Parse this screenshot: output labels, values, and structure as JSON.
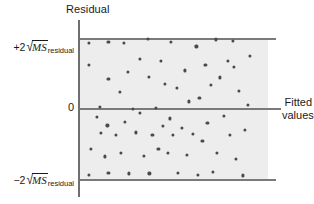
{
  "figure": {
    "type": "residual-plot",
    "axis_title": "Residual",
    "x_axis_label_line1": "Fitted",
    "x_axis_label_line2": "values",
    "zero_tick": "0",
    "upper_limit": {
      "sign": "+2",
      "radical_glyph": "√",
      "radicand": "MS",
      "subscript": "residual",
      "full_text": "+2√MS_residual"
    },
    "lower_limit": {
      "sign": "−2",
      "radical_glyph": "√",
      "radicand": "MS",
      "subscript": "residual",
      "full_text": "−2√MS_residual"
    },
    "colors": {
      "band_fill": "#ededed",
      "reference_line": "#7a7a7a",
      "axis_line": "#6f6f6f",
      "point_fill": "#4a4a4a",
      "background": "#ffffff",
      "text": "#1a1a1a"
    }
  },
  "chart_data": {
    "type": "scatter",
    "title": "",
    "xlabel": "Fitted values",
    "ylabel": "Residual",
    "grid": false,
    "legend": "none",
    "xlim": [
      0,
      100
    ],
    "ylim": [
      -1.1,
      1.1
    ],
    "reference_lines": [
      {
        "name": "upper-limit",
        "y": 1.0,
        "label": "+2√MS_residual"
      },
      {
        "name": "zero",
        "y": 0.0,
        "label": "0"
      },
      {
        "name": "lower-limit",
        "y": -1.0,
        "label": "−2√MS_residual"
      }
    ],
    "band": {
      "y_from": -1.0,
      "y_to": 1.0,
      "fill": "#ededed"
    },
    "points": [
      {
        "x": 4.2,
        "y": 0.93
      },
      {
        "x": 4.2,
        "y": 0.62
      },
      {
        "x": 5.3,
        "y": -0.57
      },
      {
        "x": 4.2,
        "y": -0.94
      },
      {
        "x": 8.5,
        "y": -0.12
      },
      {
        "x": 10.1,
        "y": 0.02
      },
      {
        "x": 10.6,
        "y": -0.35
      },
      {
        "x": 12.7,
        "y": -0.68
      },
      {
        "x": 14.8,
        "y": 0.94
      },
      {
        "x": 14.8,
        "y": 0.42
      },
      {
        "x": 14.3,
        "y": -0.24
      },
      {
        "x": 14.8,
        "y": -0.91
      },
      {
        "x": 19.0,
        "y": -0.37
      },
      {
        "x": 21.2,
        "y": 0.23
      },
      {
        "x": 21.7,
        "y": -0.63
      },
      {
        "x": 23.3,
        "y": 0.93
      },
      {
        "x": 23.8,
        "y": -0.19
      },
      {
        "x": 25.4,
        "y": 0.52
      },
      {
        "x": 25.9,
        "y": -0.92
      },
      {
        "x": 28.0,
        "y": 0.0
      },
      {
        "x": 29.6,
        "y": -0.34
      },
      {
        "x": 31.7,
        "y": 0.7
      },
      {
        "x": 31.7,
        "y": -0.06
      },
      {
        "x": 33.9,
        "y": -0.67
      },
      {
        "x": 36.0,
        "y": 0.99
      },
      {
        "x": 36.5,
        "y": 0.45
      },
      {
        "x": 37.0,
        "y": -0.92
      },
      {
        "x": 38.6,
        "y": -0.38
      },
      {
        "x": 40.7,
        "y": 0.01
      },
      {
        "x": 41.8,
        "y": -0.57
      },
      {
        "x": 43.4,
        "y": 0.68
      },
      {
        "x": 44.4,
        "y": -0.25
      },
      {
        "x": 45.5,
        "y": 0.35
      },
      {
        "x": 47.1,
        "y": -0.63
      },
      {
        "x": 48.7,
        "y": 0.95
      },
      {
        "x": 48.1,
        "y": -0.14
      },
      {
        "x": 49.7,
        "y": -0.37
      },
      {
        "x": 51.9,
        "y": 0.29
      },
      {
        "x": 52.4,
        "y": -0.91
      },
      {
        "x": 54.5,
        "y": -0.27
      },
      {
        "x": 56.1,
        "y": 0.54
      },
      {
        "x": 57.1,
        "y": -0.66
      },
      {
        "x": 58.2,
        "y": 0.1
      },
      {
        "x": 60.3,
        "y": -0.36
      },
      {
        "x": 62.4,
        "y": 0.88
      },
      {
        "x": 63.0,
        "y": -0.94
      },
      {
        "x": 64.0,
        "y": 0.15
      },
      {
        "x": 65.6,
        "y": -0.46
      },
      {
        "x": 67.2,
        "y": 0.62
      },
      {
        "x": 68.3,
        "y": -0.21
      },
      {
        "x": 70.4,
        "y": 0.33
      },
      {
        "x": 71.4,
        "y": -0.9
      },
      {
        "x": 73.0,
        "y": 0.98
      },
      {
        "x": 73.5,
        "y": -0.63
      },
      {
        "x": 75.1,
        "y": 0.44
      },
      {
        "x": 77.2,
        "y": -0.11
      },
      {
        "x": 79.4,
        "y": 0.68
      },
      {
        "x": 80.4,
        "y": -0.37
      },
      {
        "x": 82.0,
        "y": 0.96
      },
      {
        "x": 82.5,
        "y": 0.59
      },
      {
        "x": 83.6,
        "y": -0.72
      },
      {
        "x": 85.2,
        "y": 0.25
      },
      {
        "x": 87.3,
        "y": -0.95
      },
      {
        "x": 88.4,
        "y": -0.3
      },
      {
        "x": 90.0,
        "y": 0.05
      },
      {
        "x": 91.5,
        "y": 0.75
      }
    ]
  }
}
